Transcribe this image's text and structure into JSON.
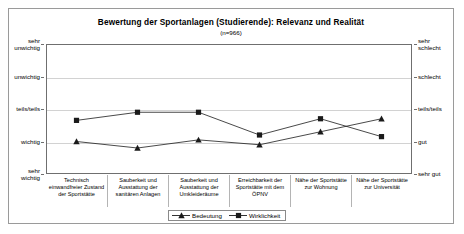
{
  "chart_data": {
    "type": "line",
    "title": "Bewertung der Sportanlagen (Studierende): Relevanz und Realität",
    "subtitle": "(n=966)",
    "xlabel": "",
    "ylabel": "",
    "grid": true,
    "legend_position": "bottom",
    "ylim": [
      1,
      5
    ],
    "categories": [
      "Technisch einwandfreier Zustand der Sportstätte",
      "Sauberkeit und Ausstattung der sanitären Anlagen",
      "Sauberkeit und Ausstattung der Umkleideräume",
      "Erreichbarkeit der Sportstätte mit dem ÖPNV",
      "Nähe der Sportstätte zur Wohnung",
      "Nähe der Sportstätte zur Universität"
    ],
    "category_lines": [
      [
        "Technisch",
        "einwandfreier Zustand",
        "der Sportstätte"
      ],
      [
        "Sauberkeit und",
        "Ausstattung der",
        "sanitären Anlagen"
      ],
      [
        "Sauberkeit und",
        "Ausstattung der",
        "Umkleideräume"
      ],
      [
        "Erreichbarkeit der",
        "Sportstätte mit dem",
        "ÖPNV"
      ],
      [
        "Nähe der Sportstätte",
        "zur Wohnung"
      ],
      [
        "Nähe der Sportstätte",
        "zur Universität"
      ]
    ],
    "yaxis_left": {
      "labels": [
        [
          "sehr",
          "unwichtig"
        ],
        [
          "unwichtig"
        ],
        [
          "teils/teils"
        ],
        [
          "wichtig"
        ],
        [
          "sehr",
          "wichtig"
        ]
      ],
      "values": [
        5,
        4,
        3,
        2,
        1
      ]
    },
    "yaxis_right": {
      "labels": [
        [
          "sehr",
          "schlecht"
        ],
        [
          "schlecht"
        ],
        [
          "teils/teils"
        ],
        [
          "gut"
        ],
        [
          "sehr gut"
        ]
      ],
      "values": [
        5,
        4,
        3,
        2,
        1
      ]
    },
    "series": [
      {
        "name": "Bedeutung",
        "marker": "triangle",
        "color": "#1a1a1a",
        "values": [
          2.0,
          1.8,
          2.05,
          1.9,
          2.3,
          2.7
        ]
      },
      {
        "name": "Wirklichkeit",
        "marker": "square",
        "color": "#1a1a1a",
        "values": [
          2.65,
          2.9,
          2.9,
          2.2,
          2.7,
          2.15
        ]
      }
    ]
  },
  "legend": {
    "items": [
      {
        "label": "Bedeutung",
        "marker": "triangle"
      },
      {
        "label": "Wirklichkeit",
        "marker": "square"
      }
    ]
  }
}
